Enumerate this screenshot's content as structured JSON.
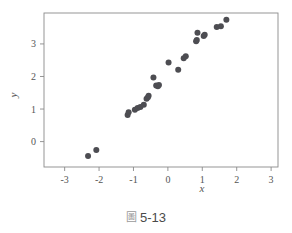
{
  "caption": {
    "prefix": "圖",
    "number": "5-13"
  },
  "chart_data": {
    "type": "scatter",
    "title": "",
    "xlabel": "x",
    "ylabel": "y",
    "xlim": [
      -3.6,
      3.2
    ],
    "ylim": [
      -0.78,
      3.95
    ],
    "xticks": [
      -3,
      -2,
      -1,
      0,
      1,
      2,
      3
    ],
    "xticklabels": [
      "-3",
      "-2",
      "-1",
      "0",
      "1",
      "2",
      "3"
    ],
    "yticks": [
      0,
      1,
      2,
      3
    ],
    "yticklabels": [
      "0",
      "1",
      "2",
      "3"
    ],
    "grid": false,
    "legend": null,
    "marker": {
      "shape": "circle",
      "color": "#4d4d52",
      "size": 3.0
    },
    "frame": {
      "box": true,
      "color": "#8a8a8a"
    },
    "points": [
      {
        "x": -2.32,
        "y": -0.44
      },
      {
        "x": -2.08,
        "y": -0.26
      },
      {
        "x": -1.17,
        "y": 0.82
      },
      {
        "x": -1.14,
        "y": 0.9
      },
      {
        "x": -0.96,
        "y": 0.98
      },
      {
        "x": -0.88,
        "y": 1.03
      },
      {
        "x": -0.8,
        "y": 1.06
      },
      {
        "x": -0.7,
        "y": 1.13
      },
      {
        "x": -0.62,
        "y": 1.32
      },
      {
        "x": -0.58,
        "y": 1.36
      },
      {
        "x": -0.56,
        "y": 1.41
      },
      {
        "x": -0.42,
        "y": 1.97
      },
      {
        "x": -0.34,
        "y": 1.72
      },
      {
        "x": -0.29,
        "y": 1.7
      },
      {
        "x": -0.26,
        "y": 1.74
      },
      {
        "x": 0.02,
        "y": 2.43
      },
      {
        "x": 0.3,
        "y": 2.21
      },
      {
        "x": 0.46,
        "y": 2.56
      },
      {
        "x": 0.52,
        "y": 2.62
      },
      {
        "x": 0.82,
        "y": 3.08
      },
      {
        "x": 0.84,
        "y": 3.12
      },
      {
        "x": 0.86,
        "y": 3.34
      },
      {
        "x": 1.04,
        "y": 3.24
      },
      {
        "x": 1.07,
        "y": 3.28
      },
      {
        "x": 1.42,
        "y": 3.52
      },
      {
        "x": 1.54,
        "y": 3.54
      },
      {
        "x": 1.7,
        "y": 3.74
      }
    ]
  }
}
